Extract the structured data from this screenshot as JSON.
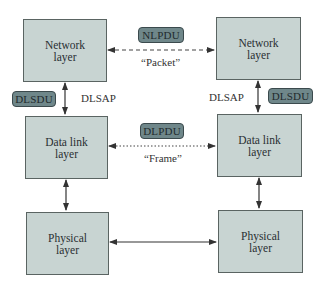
{
  "diagram": {
    "colors": {
      "box_fill": "#c8d4d2",
      "box_border": "#5a6462",
      "badge_fill": "#6f878a",
      "badge_border": "#3b4a4d",
      "line": "#333333"
    },
    "left_stack": {
      "network": {
        "line1": "Network",
        "line2": "layer"
      },
      "datalink": {
        "line1": "Data link",
        "line2": "layer"
      },
      "physical": {
        "line1": "Physical",
        "line2": "layer"
      },
      "dlsdu_badge": "DLSDU",
      "dlsap_label": "DLSAP"
    },
    "right_stack": {
      "network": {
        "line1": "Network",
        "line2": "layer"
      },
      "datalink": {
        "line1": "Data link",
        "line2": "layer"
      },
      "physical": {
        "line1": "Physical",
        "line2": "layer"
      },
      "dlsdu_badge": "DLSDU",
      "dlsap_label": "DLSAP"
    },
    "peer_links": {
      "network": {
        "badge": "NLPDU",
        "caption": "“Packet”",
        "style": "dashed"
      },
      "datalink": {
        "badge": "DLPDU",
        "caption": "“Frame”",
        "style": "dotted"
      },
      "physical": {
        "style": "solid"
      }
    }
  }
}
